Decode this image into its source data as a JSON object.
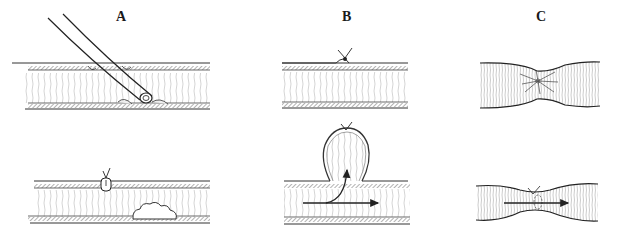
{
  "figure": {
    "panels": [
      {
        "id": "A",
        "label": "A"
      },
      {
        "id": "B",
        "label": "B"
      },
      {
        "id": "C",
        "label": "C"
      }
    ],
    "colors": {
      "ink": "#2a2a2a",
      "hatch": "#8a8a8a",
      "background": "#ffffff"
    }
  }
}
